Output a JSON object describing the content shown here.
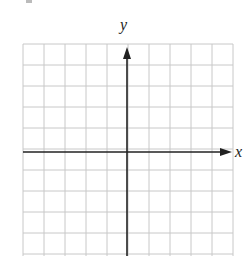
{
  "diagram": {
    "type": "coordinate-plane",
    "x_axis_label": "x",
    "y_axis_label": "y",
    "grid": {
      "columns": 10,
      "rows_visible": 10,
      "cell_size_px": 21,
      "line_color": "#c8c8c8"
    },
    "axis_color": "#222222",
    "origin_px": [
      127,
      152
    ],
    "arrows": [
      "positive-x",
      "positive-y"
    ]
  }
}
